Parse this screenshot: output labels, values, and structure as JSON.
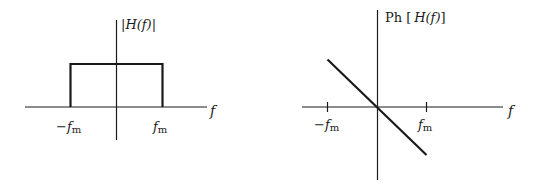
{
  "figure": {
    "left_plot": {
      "ylabel": "|H(f)|",
      "xlabel": "f",
      "tick_neg": "−f",
      "tick_neg_sub": "m",
      "tick_pos": "f",
      "tick_pos_sub": "m",
      "shape": "rectangle (ideal low-pass magnitude)"
    },
    "right_plot": {
      "ylabel_prefix": "Ph",
      "ylabel_open": "[",
      "ylabel_func": "H(f)",
      "ylabel_close": "]",
      "xlabel": "f",
      "tick_neg": "−f",
      "tick_neg_sub": "m",
      "tick_pos": "f",
      "tick_pos_sub": "m",
      "shape": "straight line with negative slope through origin (linear phase)"
    },
    "colors": {
      "stroke": "#1a1a1a",
      "background": "#ffffff"
    }
  }
}
